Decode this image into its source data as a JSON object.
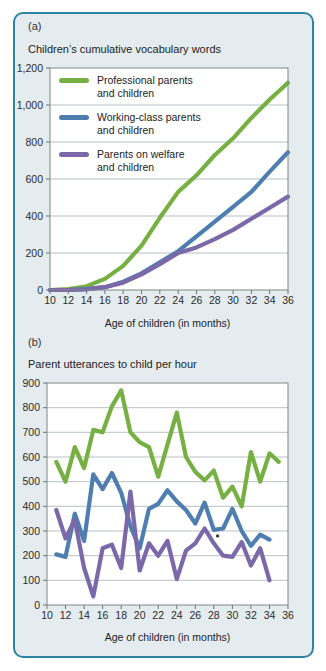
{
  "figure": {
    "panel_a_label": "(a)",
    "panel_b_label": "(b)"
  },
  "colors": {
    "frame_border": "#2f84a6",
    "panel_background": "#e5ecef",
    "plot_background": "#ffffff",
    "gridline": "#b9c0c3",
    "axis_border": "#7e8588",
    "tick": "#6b7276",
    "text": "#2b2b2b",
    "professional_green": "#76b043",
    "working_class_blue": "#4e7eb0",
    "welfare_purple": "#7a68a8"
  },
  "legend": {
    "items": [
      {
        "line1": "Professional parents",
        "line2": "and children",
        "color": "#76b043"
      },
      {
        "line1": "Working-class parents",
        "line2": "and children",
        "color": "#4e7eb0"
      },
      {
        "line1": "Parents on welfare",
        "line2": "and children",
        "color": "#7a68a8"
      }
    ]
  },
  "chart_data": [
    {
      "type": "line",
      "panel": "a",
      "title": "Children’s cumulative vocabulary words",
      "xlabel": "Age of children (in months)",
      "ylabel": "",
      "xlim": [
        10,
        36
      ],
      "ylim": [
        0,
        1200
      ],
      "grid": true,
      "legend_position": "inside-top-left",
      "xticks": [
        "10",
        "12",
        "14",
        "16",
        "18",
        "20",
        "22",
        "24",
        "26",
        "28",
        "30",
        "32",
        "34",
        "36"
      ],
      "yticks": [
        "0",
        "200",
        "400",
        "600",
        "800",
        "1,000",
        "1,200"
      ],
      "x": [
        10,
        12,
        14,
        16,
        18,
        20,
        22,
        24,
        26,
        28,
        30,
        32,
        34,
        36
      ],
      "series": [
        {
          "key": "professional-parents",
          "name": "Professional parents and children",
          "color": "#76b043",
          "values": [
            0,
            5,
            20,
            60,
            130,
            240,
            390,
            530,
            620,
            730,
            820,
            930,
            1030,
            1120
          ]
        },
        {
          "key": "working-class-parents",
          "name": "Working-class parents and children",
          "color": "#4e7eb0",
          "values": [
            0,
            0,
            5,
            15,
            45,
            90,
            150,
            210,
            290,
            370,
            450,
            530,
            640,
            745
          ]
        },
        {
          "key": "welfare-parents",
          "name": "Parents on welfare and children",
          "color": "#7a68a8",
          "values": [
            0,
            0,
            5,
            15,
            40,
            85,
            140,
            200,
            230,
            275,
            325,
            385,
            445,
            505
          ]
        }
      ]
    },
    {
      "type": "line",
      "panel": "b",
      "title": "Parent utterances to child per hour",
      "xlabel": "Age of children (in months)",
      "ylabel": "",
      "xlim": [
        10,
        36
      ],
      "ylim": [
        0,
        900
      ],
      "grid": true,
      "xticks": [
        "10",
        "12",
        "14",
        "16",
        "18",
        "20",
        "22",
        "24",
        "26",
        "28",
        "30",
        "32",
        "34",
        "36"
      ],
      "yticks": [
        "0",
        "100",
        "200",
        "300",
        "400",
        "500",
        "600",
        "700",
        "800",
        "900"
      ],
      "series": [
        {
          "key": "professional-parents",
          "name": "Professional parents and children",
          "color": "#76b043",
          "x": [
            11,
            12,
            13,
            14,
            15,
            16,
            17,
            18,
            19,
            20,
            21,
            22,
            23,
            24,
            25,
            26,
            27,
            28,
            29,
            30,
            31,
            32,
            33,
            34,
            35
          ],
          "values": [
            580,
            500,
            640,
            555,
            710,
            700,
            805,
            870,
            700,
            660,
            640,
            520,
            650,
            780,
            600,
            540,
            505,
            545,
            435,
            480,
            400,
            620,
            500,
            615,
            580
          ]
        },
        {
          "key": "working-class-parents",
          "name": "Working-class parents and children",
          "color": "#4e7eb0",
          "x": [
            11,
            12,
            13,
            14,
            15,
            16,
            17,
            18,
            19,
            20,
            21,
            22,
            23,
            24,
            25,
            26,
            27,
            28,
            29,
            30,
            31,
            32,
            33,
            34
          ],
          "values": [
            205,
            195,
            370,
            260,
            530,
            470,
            535,
            455,
            320,
            230,
            390,
            410,
            465,
            420,
            385,
            330,
            415,
            305,
            310,
            390,
            300,
            240,
            285,
            265
          ]
        },
        {
          "key": "welfare-parents",
          "name": "Parents on welfare and children",
          "color": "#7a68a8",
          "x": [
            11,
            12,
            13,
            14,
            15,
            16,
            17,
            18,
            19,
            20,
            21,
            22,
            23,
            24,
            25,
            26,
            27,
            28,
            29,
            30,
            31,
            32,
            33,
            34
          ],
          "values": [
            385,
            270,
            345,
            150,
            35,
            230,
            245,
            150,
            460,
            140,
            250,
            200,
            260,
            105,
            220,
            250,
            310,
            250,
            200,
            195,
            255,
            160,
            230,
            100
          ]
        }
      ],
      "annotations": [
        {
          "type": "dot",
          "x": 28.4,
          "y": 280
        }
      ]
    }
  ]
}
